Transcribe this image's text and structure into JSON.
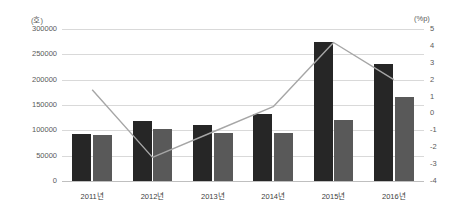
{
  "axes": {
    "left_unit": "(호)",
    "right_unit": "(%p)",
    "left_ticks": [
      "300000",
      "250000",
      "200000",
      "150000",
      "100000",
      "50000",
      "0"
    ],
    "right_ticks": [
      "5",
      "4",
      "3",
      "2",
      "1",
      "0",
      "-1",
      "-2",
      "-3",
      "-4"
    ]
  },
  "colors": {
    "bar_series_1": "#262626",
    "bar_series_2": "#595959",
    "line_series": "#a6a6a6",
    "gridline": "#d9d9d9",
    "axis_text": "#595959"
  },
  "chart_data": {
    "type": "bar",
    "title": "",
    "xlabel": "",
    "ylabel": "(호)",
    "y2label": "(%p)",
    "categories": [
      "2011년",
      "2012년",
      "2013년",
      "2014년",
      "2015년",
      "2016년"
    ],
    "ylim": [
      0,
      300000
    ],
    "y2lim": [
      -4,
      5
    ],
    "grid": true,
    "legend": "none",
    "series": [
      {
        "name": "bar-series-1",
        "type": "bar",
        "axis": "left",
        "values": [
          93000,
          118000,
          110000,
          133000,
          275000,
          230000
        ]
      },
      {
        "name": "bar-series-2",
        "type": "bar",
        "axis": "left",
        "values": [
          90000,
          103000,
          95000,
          95000,
          120000,
          165000
        ]
      },
      {
        "name": "line-series",
        "type": "line",
        "axis": "right",
        "values": [
          1.4,
          -2.6,
          -1.1,
          0.4,
          4.2,
          2.0
        ]
      }
    ]
  }
}
